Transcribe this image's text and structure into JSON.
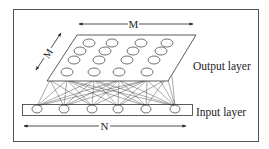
{
  "diagram": {
    "type": "neural-network-som",
    "labels": {
      "output_layer": "Output layer",
      "input_layer": "Input layer",
      "top_dimension": "M",
      "depth_dimension": "M",
      "bottom_dimension": "N"
    },
    "output_layer": {
      "rows": 4,
      "cols": 4,
      "nodes": [
        [
          [
            89,
            43
          ],
          [
            112,
            43
          ],
          [
            141,
            43
          ],
          [
            167,
            43
          ]
        ],
        [
          [
            80,
            51
          ],
          [
            105,
            51
          ],
          [
            133,
            51
          ],
          [
            161,
            51
          ]
        ],
        [
          [
            74,
            60
          ],
          [
            99,
            60
          ],
          [
            127,
            60
          ],
          [
            154,
            60
          ]
        ],
        [
          [
            67,
            70
          ],
          [
            94,
            70
          ],
          [
            119,
            70
          ],
          [
            147,
            70
          ]
        ]
      ]
    },
    "input_layer": {
      "count": 6,
      "nodes": [
        [
          37,
          109
        ],
        [
          64,
          109
        ],
        [
          92,
          109
        ],
        [
          118,
          109
        ],
        [
          146,
          109
        ],
        [
          175,
          109
        ]
      ]
    },
    "colors": {
      "stroke": "#333333",
      "background": "#ffffff",
      "frame": "#555555"
    }
  }
}
